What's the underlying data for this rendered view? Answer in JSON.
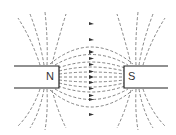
{
  "diagram": {
    "north_label": "N",
    "south_label": "S",
    "line_color": "#555555",
    "magnet_color": "#222222"
  }
}
